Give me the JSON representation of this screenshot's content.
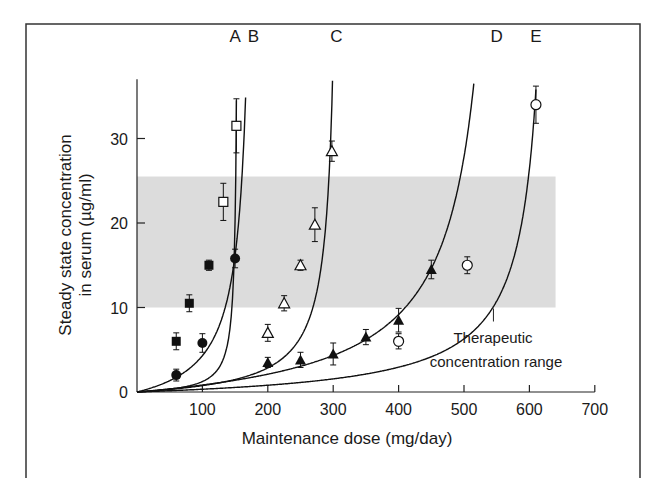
{
  "chart_data": {
    "type": "line",
    "title": "",
    "xlabel": "Maintenance dose (mg/day)",
    "ylabel_line1": "Steady state concentration",
    "ylabel_line2": "in serum (µg/ml)",
    "xlim": [
      0,
      700
    ],
    "ylim": [
      0,
      36
    ],
    "x_ticks": [
      100,
      200,
      300,
      400,
      500,
      600,
      700
    ],
    "y_ticks": [
      0,
      10,
      20,
      30
    ],
    "grid": false,
    "shaded_region": {
      "label_line1": "Therapeutic",
      "label_line2": "concentration range",
      "y_range": [
        10,
        25.5
      ],
      "x_range": [
        0,
        640
      ],
      "color": "#dcdcdc"
    },
    "series": [
      {
        "name": "A",
        "marker": "open-square-and-filled-square",
        "points": [
          {
            "x": 60,
            "y": 6.0,
            "err": 1.0,
            "marker": "filled-square"
          },
          {
            "x": 80,
            "y": 10.5,
            "err": 1.0,
            "marker": "filled-square"
          },
          {
            "x": 110,
            "y": 15.0,
            "err": 0.6,
            "marker": "filled-square"
          },
          {
            "x": 132,
            "y": 22.5,
            "err": 2.2,
            "marker": "open-square"
          },
          {
            "x": 152,
            "y": 31.5,
            "err": 3.2,
            "marker": "open-square"
          }
        ],
        "curve_k": 155,
        "curve_label_x": 150
      },
      {
        "name": "B",
        "marker": "filled-circle",
        "points": [
          {
            "x": 60,
            "y": 2.0,
            "err": 0.7
          },
          {
            "x": 100,
            "y": 5.8,
            "err": 1.1
          },
          {
            "x": 150,
            "y": 15.8,
            "err": 1.1
          }
        ],
        "curve_k": 183,
        "curve_label_x": 178
      },
      {
        "name": "C",
        "marker": "open-triangle",
        "points": [
          {
            "x": 200,
            "y": 7.0,
            "err": 1.0
          },
          {
            "x": 225,
            "y": 10.5,
            "err": 0.9
          },
          {
            "x": 250,
            "y": 15.0,
            "err": 0.6
          },
          {
            "x": 272,
            "y": 19.8,
            "err": 2.0
          },
          {
            "x": 298,
            "y": 28.5,
            "err": 1.2
          }
        ],
        "curve_k": 312,
        "curve_label_x": 305
      },
      {
        "name": "D",
        "marker": "filled-triangle",
        "points": [
          {
            "x": 200,
            "y": 3.5,
            "err": 0.6
          },
          {
            "x": 250,
            "y": 3.8,
            "err": 0.9
          },
          {
            "x": 300,
            "y": 4.5,
            "err": 1.3
          },
          {
            "x": 350,
            "y": 6.5,
            "err": 0.9
          },
          {
            "x": 400,
            "y": 8.5,
            "err": 1.4
          },
          {
            "x": 450,
            "y": 14.5,
            "err": 1.1
          }
        ],
        "curve_k": 570,
        "curve_label_x": 550
      },
      {
        "name": "E",
        "marker": "open-circle",
        "points": [
          {
            "x": 400,
            "y": 6.0,
            "err": 0.9
          },
          {
            "x": 505,
            "y": 15.0,
            "err": 1.0
          },
          {
            "x": 610,
            "y": 34.0,
            "err": 2.2
          }
        ],
        "curve_k": 640,
        "curve_label_x": 610
      }
    ]
  }
}
